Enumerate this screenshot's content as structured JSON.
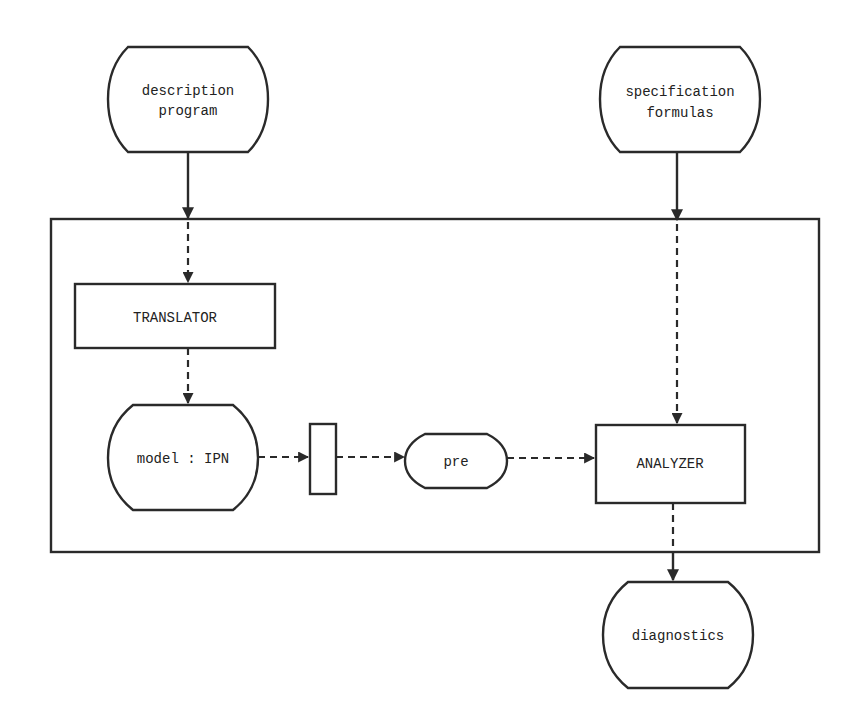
{
  "diagram": {
    "nodes": {
      "description_program": {
        "line1": "description",
        "line2": "program"
      },
      "specification_formulas": {
        "line1": "specification",
        "line2": "formulas"
      },
      "translator": {
        "label": "TRANSLATOR"
      },
      "model_ipn": {
        "label": "model : IPN"
      },
      "pre": {
        "label": "pre"
      },
      "analyzer": {
        "label": "ANALYZER"
      },
      "diagnostics": {
        "label": "diagnostics"
      }
    },
    "edges": [
      {
        "from": "description program",
        "to": "TRANSLATOR",
        "style": "solid-then-dashed"
      },
      {
        "from": "specification formulas",
        "to": "ANALYZER",
        "style": "solid-then-dashed"
      },
      {
        "from": "TRANSLATOR",
        "to": "model : IPN",
        "style": "dashed"
      },
      {
        "from": "model : IPN",
        "to": "transition",
        "style": "dashed"
      },
      {
        "from": "transition",
        "to": "pre",
        "style": "dashed"
      },
      {
        "from": "pre",
        "to": "ANALYZER",
        "style": "dashed"
      },
      {
        "from": "ANALYZER",
        "to": "diagnostics",
        "style": "dashed-then-solid"
      }
    ]
  }
}
